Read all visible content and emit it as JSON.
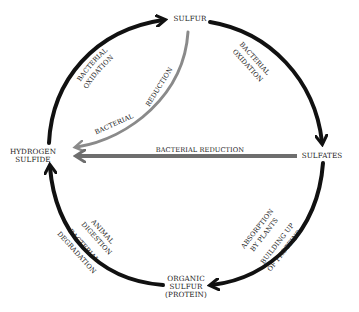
{
  "diagram": {
    "colors": {
      "main_arrow": "#111111",
      "reduction_arrow": "#8a8a8a",
      "horizontal_arrow": "#6e6e6e",
      "text": "#1a1a1a",
      "background": "#ffffff"
    },
    "nodes": {
      "sulfur": "SULFUR",
      "sulfates": "SULFATES",
      "hydrogen_sulfide_line1": "HYDROGEN",
      "hydrogen_sulfide_line2": "SULFIDE",
      "organic_line1": "ORGANIC",
      "organic_line2": "SULFUR",
      "organic_line3": "(PROTEIN)"
    },
    "edges": {
      "h2s_to_sulfur": {
        "line1": "BACTERIAL",
        "line2": "OXIDATION"
      },
      "sulfur_to_sulfates": {
        "line1": "BACTERIAL",
        "line2": "OXIDATION"
      },
      "sulfates_to_organic": {
        "line1": "ABSORPTION",
        "line2": "BY PLANTS",
        "line3": "BUILDING UP",
        "line4": "OF PROTEINS"
      },
      "organic_to_h2s": {
        "line1": "ANIMAL",
        "line2": "DIGESTION",
        "line3": "BACTERIAL",
        "line4": "DEGRADATION"
      },
      "sulfur_to_h2s": {
        "line1": "BACTERIAL",
        "line2": "REDUCTION"
      },
      "sulfates_to_h2s": {
        "line1": "BACTERIAL REDUCTION"
      }
    }
  }
}
